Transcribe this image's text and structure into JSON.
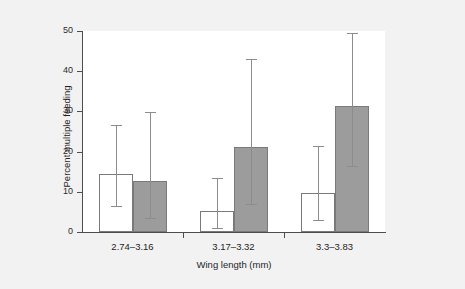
{
  "chart_data": {
    "type": "bar",
    "title": "",
    "xlabel": "Wing length (mm)",
    "ylabel": "Percent multiple feeding",
    "categories": [
      "2.74–3.16",
      "3.17–3.32",
      "3.3–3.83"
    ],
    "ylim": [
      0,
      50
    ],
    "yticks": [
      0,
      10,
      20,
      30,
      40,
      50
    ],
    "ytick_labels": [
      "0",
      "10",
      "20",
      "30",
      "40",
      "50"
    ],
    "grid": false,
    "legend": "none",
    "error_bar_style": "95% confidence interval",
    "series": [
      {
        "name": "open",
        "fill": "#ffffff",
        "values": [
          14.5,
          5.2,
          9.8
        ],
        "err_low": [
          6.5,
          1.1,
          3.1
        ],
        "err_high": [
          26.7,
          13.4,
          21.4
        ]
      },
      {
        "name": "filled",
        "fill": "#9c9c9c",
        "values": [
          12.7,
          21.2,
          31.4
        ],
        "err_low": [
          3.5,
          6.9,
          16.4
        ],
        "err_high": [
          29.9,
          43.0,
          49.4
        ]
      }
    ]
  },
  "colors": {
    "figure_background": "#f2f2f2",
    "plot_background": "#ffffff",
    "axis": "#4d4d4d",
    "bar_open_fill": "#ffffff",
    "bar_filled_fill": "#9c9c9c",
    "bar_edge": "#7a7a7a",
    "error_bar": "#8c8c8c",
    "text": "#1f1f1f"
  }
}
